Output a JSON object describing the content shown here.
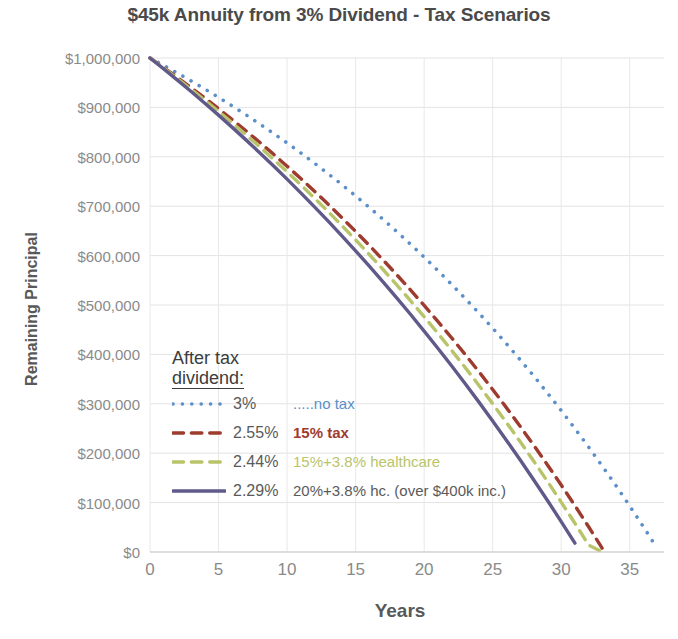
{
  "chart_data": {
    "type": "line",
    "title": "$45k Annuity from 3% Dividend - Tax Scenarios",
    "xlabel": "Years",
    "ylabel": "Remaining Principal",
    "xlim": [
      0,
      37.5
    ],
    "ylim": [
      0,
      1000000
    ],
    "grid": true,
    "legend_position": "inside-left",
    "x_ticks": [
      "0",
      "5",
      "10",
      "15",
      "20",
      "25",
      "30",
      "35"
    ],
    "x_tick_values": [
      0,
      5,
      10,
      15,
      20,
      25,
      30,
      35
    ],
    "y_ticks": [
      "$0",
      "$100,000",
      "$200,000",
      "$300,000",
      "$400,000",
      "$500,000",
      "$600,000",
      "$700,000",
      "$800,000",
      "$900,000",
      "$1,000,000"
    ],
    "y_tick_values": [
      0,
      100000,
      200000,
      300000,
      400000,
      500000,
      600000,
      700000,
      800000,
      900000,
      1000000
    ],
    "starting_principal": 1000000,
    "annual_withdrawal": 45000,
    "series": [
      {
        "name": "no tax",
        "rate_label": "3%",
        "rate": 0.03,
        "color": "#5b8fc9",
        "style": "dotted",
        "x": [
          0,
          1,
          2,
          3,
          4,
          5,
          6,
          7,
          8,
          9,
          10,
          11,
          12,
          13,
          14,
          15,
          16,
          17,
          18,
          19,
          20,
          21,
          22,
          23,
          24,
          25,
          26,
          27,
          28,
          29,
          30,
          31,
          32,
          33,
          34,
          35,
          36,
          37
        ],
        "values": [
          1000000,
          985000,
          969550,
          953637,
          937246,
          920363,
          902974,
          885063,
          866615,
          847613,
          828042,
          807883,
          787119,
          765733,
          743705,
          721016,
          697646,
          673576,
          648783,
          623247,
          596944,
          569852,
          541948,
          513206,
          483602,
          453110,
          421704,
          389355,
          356035,
          321716,
          286368,
          249959,
          212458,
          173832,
          134047,
          93068,
          50860,
          7386
        ]
      },
      {
        "name": "15% tax",
        "rate_label": "2.55%",
        "rate": 0.0255,
        "color": "#9e3b2f",
        "style": "dashed",
        "x": [
          0,
          1,
          2,
          3,
          4,
          5,
          6,
          7,
          8,
          9,
          10,
          11,
          12,
          13,
          14,
          15,
          16,
          17,
          18,
          19,
          20,
          21,
          22,
          23,
          24,
          25,
          26,
          27,
          28,
          29,
          30,
          31,
          32,
          33
        ],
        "values": [
          1000000,
          980500,
          960503,
          939995,
          918965,
          897399,
          875283,
          852603,
          829347,
          805496,
          781036,
          755952,
          730225,
          703840,
          676778,
          649021,
          620551,
          591348,
          561393,
          530668,
          499150,
          466820,
          433656,
          399637,
          364740,
          328942,
          292220,
          254549,
          215905,
          176261,
          135593,
          93872,
          51070,
          7159
        ]
      },
      {
        "name": "15%+3.8% healthcare",
        "rate_label": "2.44%",
        "rate": 0.0244,
        "color": "#b9c46a",
        "style": "dashed",
        "x": [
          0,
          1,
          2,
          3,
          4,
          5,
          6,
          7,
          8,
          9,
          10,
          11,
          12,
          13,
          14,
          15,
          16,
          17,
          18,
          19,
          20,
          21,
          22,
          23,
          24,
          25,
          26,
          27,
          28,
          29,
          30,
          31,
          32,
          33
        ],
        "values": [
          1000000,
          979400,
          958294,
          936670,
          914516,
          891818,
          868564,
          844739,
          820330,
          795323,
          769702,
          743452,
          716559,
          689005,
          660774,
          631850,
          602215,
          571849,
          540736,
          508854,
          476185,
          442705,
          408395,
          373230,
          337188,
          300243,
          262370,
          223544,
          183738,
          142922,
          101067,
          58143,
          14116,
          0
        ]
      },
      {
        "name": "20%+3.8% hc. (over $400k inc.)",
        "rate_label": "2.29%",
        "rate": 0.0229,
        "color": "#5f5a8a",
        "style": "solid",
        "x": [
          0,
          1,
          2,
          3,
          4,
          5,
          6,
          7,
          8,
          9,
          10,
          11,
          12,
          13,
          14,
          15,
          16,
          17,
          18,
          19,
          20,
          21,
          22,
          23,
          24,
          25,
          26,
          27,
          28,
          29,
          30,
          31
        ],
        "values": [
          1000000,
          977900,
          955294,
          932170,
          908517,
          884322,
          859573,
          834257,
          808361,
          781872,
          754777,
          727061,
          698711,
          669712,
          640048,
          609706,
          578668,
          546920,
          514444,
          481225,
          447245,
          412487,
          376933,
          340565,
          303364,
          265311,
          226387,
          186572,
          145845,
          104186,
          61573,
          17983
        ]
      }
    ],
    "legend_title_line1": "After tax",
    "legend_title_line2": "dividend:"
  }
}
